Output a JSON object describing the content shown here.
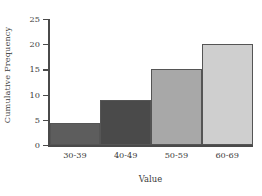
{
  "chart_data": {
    "type": "bar",
    "title": "",
    "subtitle": "",
    "xlabel": "Value",
    "ylabel": "Cumulative Frequency",
    "categories": [
      "30-39",
      "40-49",
      "50-59",
      "60-69"
    ],
    "values": [
      4.3,
      9,
      15,
      20
    ],
    "series": [
      {
        "name": "Cumulative Frequency",
        "values": [
          4.3,
          9,
          15,
          20
        ]
      }
    ],
    "bar_colors": [
      "#5d5d5d",
      "#4a4a4a",
      "#a8a8a8",
      "#cfcfcf"
    ],
    "bar_edge_color": "#555555",
    "ylim": [
      0,
      25
    ],
    "yticks": [
      0,
      5,
      10,
      15,
      20,
      25
    ],
    "ytick_labels": [
      "0",
      "5",
      "10",
      "15",
      "20",
      "25"
    ],
    "xtick_labels": [
      "30-39",
      "40-49",
      "50-59",
      "60-69"
    ],
    "grid": false,
    "legend": false,
    "legend_position": "none",
    "bars_adjacent": true,
    "background_color": "#ffffff",
    "axis_color": "#4a4a4a",
    "text_color": "#3b3b3b",
    "annotations": []
  }
}
